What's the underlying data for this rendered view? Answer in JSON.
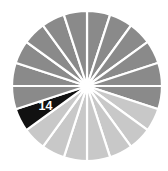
{
  "chart_data": {
    "type": "pie",
    "title": "",
    "subtitle": "",
    "xlabel": "",
    "ylabel": "",
    "grid": false,
    "legend": "none",
    "background_color": "#ffffff",
    "divider_color": "#ffffff",
    "center": {
      "x": 87,
      "y": 86
    },
    "radius": 75,
    "start_angle_deg": -90,
    "slice_count": 20,
    "equal_slices": true,
    "slice_angle_deg": 18,
    "categories": [
      "1",
      "2",
      "3",
      "4",
      "5",
      "6",
      "7",
      "8",
      "9",
      "10",
      "11",
      "12",
      "13",
      "14",
      "15",
      "16",
      "17",
      "18",
      "19",
      "20"
    ],
    "values": [
      5,
      5,
      5,
      5,
      5,
      5,
      5,
      5,
      5,
      5,
      5,
      5,
      5,
      5,
      5,
      5,
      5,
      5,
      5,
      5
    ],
    "colors": [
      "#8a8a8a",
      "#8a8a8a",
      "#8a8a8a",
      "#8a8a8a",
      "#8a8a8a",
      "#8a8a8a",
      "#c8c8c8",
      "#c8c8c8",
      "#c8c8c8",
      "#c8c8c8",
      "#c8c8c8",
      "#c8c8c8",
      "#c8c8c8",
      "#111111",
      "#8a8a8a",
      "#8a8a8a",
      "#8a8a8a",
      "#8a8a8a",
      "#8a8a8a",
      "#8a8a8a"
    ],
    "highlighted_index": 13,
    "highlight_color": "#111111",
    "gray_dark": "#8a8a8a",
    "gray_light": "#c8c8c8",
    "labels": [
      {
        "index": 13,
        "text": "14",
        "color": "#ffffff",
        "radial_position": 0.62
      }
    ],
    "annotations": []
  }
}
